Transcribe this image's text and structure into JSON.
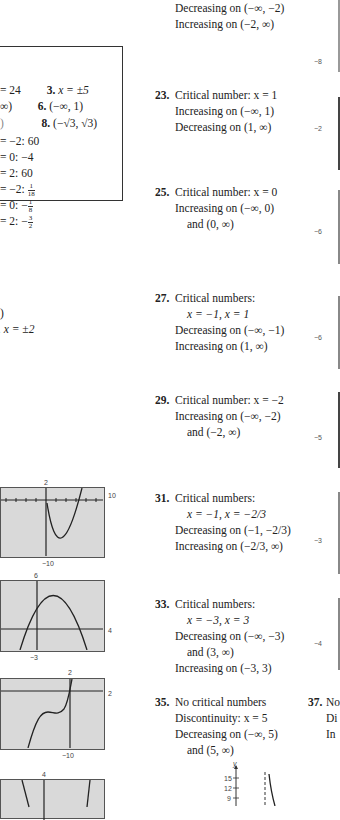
{
  "left_column": {
    "box": {
      "lines": [
        {
          "a": "= 24",
          "b_num": "3.",
          "b_text": "x = ±5"
        },
        {
          "a": "∞)",
          "b_num": "6.",
          "b_text": "(−∞, 1)"
        },
        {
          "a": ")",
          "b_num": "8.",
          "b_text": "(−√3, √3)"
        },
        {
          "a": "= −2:  60"
        },
        {
          "a": "= 0:  −4"
        },
        {
          "a": "= 2:  60"
        },
        {
          "a": "= −2:",
          "frac": {
            "n": "1",
            "d": "18"
          }
        },
        {
          "a": "= 0:  −",
          "frac": {
            "n": "1",
            "d": "8"
          }
        },
        {
          "a": "= 2:  −",
          "frac": {
            "n": "3",
            "d": "2"
          }
        }
      ]
    },
    "fragments": [
      {
        "text": ")"
      },
      {
        "text": ". x = ±2"
      }
    ],
    "graphs": [
      {
        "id": "graph-21",
        "top_label": "2",
        "right_label": "10",
        "bottom_label": "−10"
      },
      {
        "id": "graph-22",
        "top_label": "6",
        "right_label": "4",
        "bottom_label": "−3"
      },
      {
        "id": "graph-23",
        "top_label": "2",
        "right_label": "2",
        "bottom_label": "−10"
      },
      {
        "id": "graph-24",
        "top_label": "4"
      }
    ]
  },
  "middle_column": {
    "answer_21_tail": {
      "lines": [
        "Decreasing on (−∞, −2)",
        "Increasing on (−2, ∞)"
      ]
    },
    "answers": [
      {
        "number": "23.",
        "lines": [
          "Critical number: x = 1",
          "Increasing on (−∞, 1)",
          "Decreasing on (1, ∞)"
        ]
      },
      {
        "number": "25.",
        "lines": [
          "Critical number: x = 0",
          "Increasing on (−∞, 0)",
          "and (0, ∞)"
        ]
      },
      {
        "number": "27.",
        "lines": [
          "Critical numbers:",
          "x = −1, x = 1",
          "Decreasing on (−∞, −1)",
          "Increasing on (1, ∞)"
        ]
      },
      {
        "number": "29.",
        "lines": [
          "Critical number: x = −2",
          "Increasing on (−∞, −2)",
          "and (−2, ∞)"
        ]
      },
      {
        "number": "31.",
        "lines": [
          "Critical numbers:",
          "x = −1, x = −2/3",
          "Decreasing on (−1, −2/3)",
          "Increasing on (−2/3, ∞)"
        ]
      },
      {
        "number": "33.",
        "lines": [
          "Critical numbers:",
          "x = −3, x = 3",
          "Decreasing on (−∞, −3)",
          "and (3, ∞)",
          "Increasing on (−3, 3)"
        ]
      },
      {
        "number": "35.",
        "lines": [
          "No critical numbers",
          "Discontinuity: x = 5",
          "Decreasing on (−∞, 5)",
          "and (5, ∞)"
        ]
      }
    ],
    "graph_35": {
      "y_axis_label": "y",
      "y_ticks": [
        "15",
        "12",
        "9"
      ]
    }
  },
  "right_column": {
    "edge_labels": [
      "−8",
      "−2",
      "−6",
      "−6",
      "−5",
      "−3",
      "−4"
    ],
    "answer_37": {
      "number": "37.",
      "lines": [
        "No",
        "Di",
        "In"
      ]
    }
  }
}
